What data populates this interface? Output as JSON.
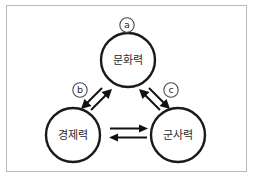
{
  "figure": {
    "type": "cycle-diagram",
    "background_color": "#ffffff",
    "border_color": "#b9b9b9",
    "stroke_color": "#111111",
    "text_color": "#2b2b2b"
  },
  "nodes": [
    {
      "id": "culture",
      "label": "문화력",
      "tag": "ⓐ",
      "tag_letter": "a",
      "position": "top",
      "cx": 128,
      "cy": 60,
      "r": 27,
      "tag_x": 127,
      "tag_y": 25
    },
    {
      "id": "economy",
      "label": "경제력",
      "tag": "ⓑ",
      "tag_letter": "b",
      "position": "bottom-left",
      "cx": 73,
      "cy": 135,
      "r": 27,
      "tag_x": 80,
      "tag_y": 90
    },
    {
      "id": "military",
      "label": "군사력",
      "tag": "ⓒ",
      "tag_letter": "c",
      "position": "bottom-right",
      "cx": 178,
      "cy": 135,
      "r": 27,
      "tag_x": 171,
      "tag_y": 90
    }
  ],
  "connectors": [
    {
      "id": "economy-culture",
      "from": "economy",
      "to": "culture",
      "style": "double-arrow",
      "direction": "bidirectional",
      "tag": "ⓑ"
    },
    {
      "id": "culture-military",
      "from": "culture",
      "to": "military",
      "style": "double-arrow",
      "direction": "bidirectional",
      "tag": "ⓒ"
    },
    {
      "id": "economy-military",
      "from": "economy",
      "to": "military",
      "style": "double-arrow",
      "direction": "bidirectional",
      "tag": ""
    }
  ]
}
